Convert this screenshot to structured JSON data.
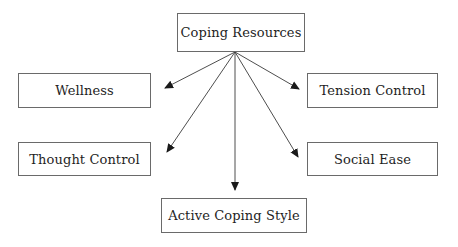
{
  "diagram": {
    "type": "hierarchy",
    "root": {
      "id": "root",
      "label": "Coping Resources"
    },
    "children": [
      {
        "id": "wellness",
        "label": "Wellness"
      },
      {
        "id": "thought",
        "label": "Thought Control"
      },
      {
        "id": "active",
        "label": "Active Coping Style"
      },
      {
        "id": "social",
        "label": "Social Ease"
      },
      {
        "id": "tension",
        "label": "Tension Control"
      }
    ],
    "edges": [
      {
        "from": "root",
        "to": "wellness"
      },
      {
        "from": "root",
        "to": "thought"
      },
      {
        "from": "root",
        "to": "active"
      },
      {
        "from": "root",
        "to": "social"
      },
      {
        "from": "root",
        "to": "tension"
      }
    ],
    "colors": {
      "box_border": "#6a6a6a",
      "text": "#1e1e1e",
      "arrow": "#3a3a3a",
      "background": "#ffffff"
    }
  }
}
